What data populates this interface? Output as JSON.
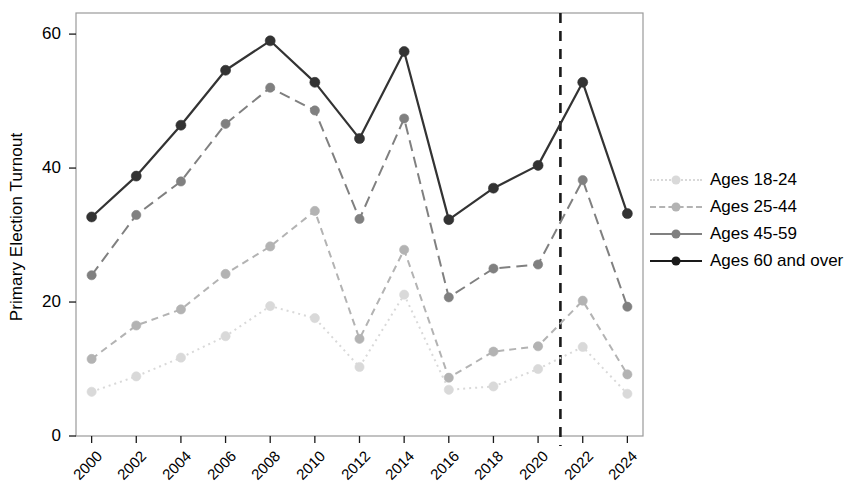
{
  "chart_data": {
    "type": "line",
    "title": "",
    "xlabel": "",
    "ylabel": "Primary Election Turnout",
    "x": [
      2000,
      2002,
      2004,
      2006,
      2008,
      2010,
      2012,
      2014,
      2016,
      2018,
      2020,
      2022,
      2024
    ],
    "xtick_labels": [
      "2000",
      "2002",
      "2004",
      "2006",
      "2008",
      "2010",
      "2012",
      "2014",
      "2016",
      "2018",
      "2020",
      "2022",
      "2024"
    ],
    "ytick_labels": [
      "0",
      "20",
      "40",
      "60"
    ],
    "yticks": [
      0,
      20,
      40,
      60
    ],
    "ylim": [
      0,
      63
    ],
    "xlim": [
      1999.3,
      2024.7
    ],
    "grid": false,
    "legend_position": "right",
    "series": [
      {
        "name": "Ages 18-24",
        "color": "#d9d9d9",
        "dash": "2,4",
        "values": [
          6.6,
          8.9,
          11.7,
          14.9,
          19.4,
          17.6,
          10.3,
          21.1,
          6.9,
          7.4,
          10.0,
          13.3,
          6.3
        ]
      },
      {
        "name": "Ages 25-44",
        "color": "#b3b3b3",
        "dash": "7,5",
        "values": [
          11.5,
          16.5,
          18.9,
          24.2,
          28.3,
          33.6,
          14.5,
          27.8,
          8.7,
          12.6,
          13.4,
          20.2,
          9.2
        ]
      },
      {
        "name": "Ages 45-59",
        "color": "#808080",
        "dash": "11,6",
        "values": [
          24.0,
          33.0,
          38.0,
          46.6,
          52.0,
          48.6,
          32.4,
          47.4,
          20.7,
          25.0,
          25.6,
          38.2,
          19.3
        ]
      },
      {
        "name": "Ages 60 and over",
        "color": "#333333",
        "dash": "none",
        "values": [
          32.7,
          38.8,
          46.4,
          54.6,
          59.0,
          52.8,
          44.4,
          57.4,
          32.3,
          37.0,
          40.4,
          52.8,
          33.2
        ]
      }
    ],
    "vertical_reference_line": {
      "x": 2021,
      "style": "dashed",
      "color": "#1a1a1a"
    }
  },
  "legend": {
    "entries": [
      {
        "label": "Ages 18-24"
      },
      {
        "label": "Ages 25-44"
      },
      {
        "label": "Ages 45-59"
      },
      {
        "label": "Ages 60 and over"
      }
    ]
  }
}
